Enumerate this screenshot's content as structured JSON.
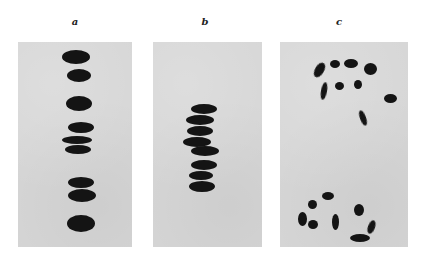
{
  "figure": {
    "panels": [
      {
        "label": "a",
        "description": "metaphase chromosomes aligned in a vertical single column"
      },
      {
        "label": "b",
        "description": "metaphase chromosomes tightly stacked in a compact column"
      },
      {
        "label": "c",
        "description": "chromosomes separated into two scattered groups (anaphase-like)"
      }
    ]
  },
  "colors": {
    "background": "#ffffff",
    "panel": "#d6d6d6",
    "chromosome": "#141414"
  }
}
